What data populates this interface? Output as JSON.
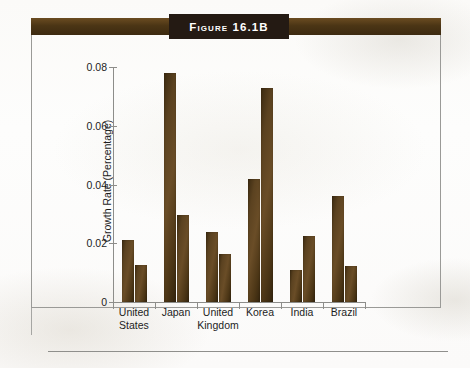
{
  "figure": {
    "label": "Figure 16.1B",
    "band_color": "#4b3515",
    "label_box_color": "#241a13",
    "bar_color": "#4c3616",
    "frame_color": "#9a9a97"
  },
  "chart_data": {
    "type": "bar",
    "title": "Figure 16.1B",
    "xlabel": "",
    "ylabel": "Growth Rate (Percentage)",
    "ylim": [
      0,
      0.08
    ],
    "yticks": [
      0,
      0.02,
      0.04,
      0.06,
      0.08
    ],
    "ytick_labels": [
      "0",
      "0.02",
      "0.04",
      "0.06",
      "0.08"
    ],
    "grid": false,
    "legend": "none",
    "categories": [
      "United States",
      "Japan",
      "United Kingdom",
      "Korea",
      "India",
      "Brazil"
    ],
    "category_lines": [
      [
        "United",
        "States"
      ],
      [
        "Japan"
      ],
      [
        "United",
        "Kingdom"
      ],
      [
        "Korea"
      ],
      [
        "India"
      ],
      [
        "Brazil"
      ]
    ],
    "series": [
      {
        "name": "Series 1",
        "values": [
          0.021,
          0.0778,
          0.0238,
          0.042,
          0.011,
          0.036
        ]
      },
      {
        "name": "Series 2",
        "values": [
          0.0125,
          0.0296,
          0.0164,
          0.0728,
          0.0225,
          0.0123
        ]
      }
    ]
  }
}
